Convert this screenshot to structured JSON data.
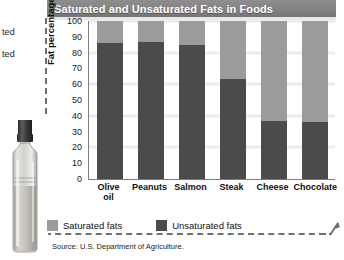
{
  "header": {
    "title": "Saturated and Unsaturated Fats in Foods"
  },
  "margin_notes": {
    "cropped_line_1": "ted",
    "cropped_line_2": "ted"
  },
  "illustration": {
    "name": "olive-oil-bottle-photo"
  },
  "legend": {
    "items": [
      {
        "label": "Saturated fats",
        "color": "#9b9b9b"
      },
      {
        "label": "Unsaturated fats",
        "color": "#4b4b4b"
      }
    ]
  },
  "source": {
    "text": "Source: U.S. Department of Agriculture."
  },
  "colors": {
    "saturated": "#9b9b9b",
    "unsaturated": "#4b4b4b",
    "title_bar": "#828282",
    "gridline": "#ececec",
    "axis": "#7d7d7d"
  },
  "chart_data": {
    "type": "bar",
    "subtype": "stacked",
    "title": "Saturated and Unsaturated Fats in Foods",
    "xlabel": "",
    "ylabel": "Fat percentage",
    "ylim": [
      0,
      100
    ],
    "yticks": [
      0,
      10,
      20,
      30,
      40,
      50,
      60,
      70,
      80,
      90,
      100
    ],
    "ytick_labels": [
      "0",
      "10",
      "20",
      "30",
      "40",
      "50",
      "60",
      "70",
      "80",
      "90",
      "100"
    ],
    "grid": true,
    "grid_axis": "y",
    "legend_position": "bottom-left",
    "categories": [
      "Olive oil",
      "Peanuts",
      "Salmon",
      "Steak",
      "Cheese",
      "Chocolate"
    ],
    "category_lines": [
      [
        "Olive",
        "oil"
      ],
      [
        "Peanuts"
      ],
      [
        "Salmon"
      ],
      [
        "Steak"
      ],
      [
        "Cheese"
      ],
      [
        "Chocolate"
      ]
    ],
    "series": [
      {
        "name": "Unsaturated fats",
        "color": "#4b4b4b",
        "values": [
          86,
          87,
          85,
          63,
          37,
          36
        ]
      },
      {
        "name": "Saturated fats",
        "color": "#9b9b9b",
        "values": [
          14,
          13,
          15,
          37,
          63,
          64
        ]
      }
    ],
    "stack_order": [
      "Unsaturated fats",
      "Saturated fats"
    ],
    "total": 100,
    "units": "percent",
    "source": "U.S. Department of Agriculture."
  }
}
